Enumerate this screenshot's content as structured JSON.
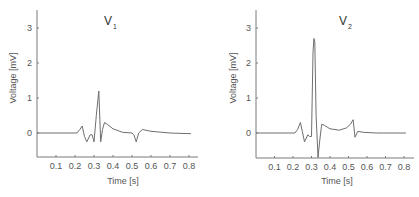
{
  "chart_data": [
    {
      "type": "line",
      "title": "V1",
      "title_main": "V",
      "title_sub": "1",
      "xlabel": "Time [s]",
      "ylabel": "Voltage [mV]",
      "xlim": [
        0,
        0.85
      ],
      "ylim": [
        -0.7,
        3.5
      ],
      "xticks": [
        0.1,
        0.2,
        0.3,
        0.4,
        0.5,
        0.6,
        0.7,
        0.8
      ],
      "xtick_labels": [
        "0.1",
        "0.2",
        "0.3",
        "0.4",
        "0.5",
        "0.6",
        "0.7",
        "0.8"
      ],
      "yticks": [
        0,
        1,
        2,
        3
      ],
      "ytick_labels": [
        "0",
        "1",
        "2",
        "3"
      ],
      "grid": false,
      "series": [
        {
          "name": "V1",
          "x": [
            0,
            0.21,
            0.225,
            0.238,
            0.25,
            0.262,
            0.28,
            0.29,
            0.3,
            0.312,
            0.325,
            0.335,
            0.345,
            0.355,
            0.37,
            0.4,
            0.45,
            0.5,
            0.51,
            0.522,
            0.535,
            0.555,
            0.6,
            0.7,
            0.81
          ],
          "y": [
            0,
            0,
            0.1,
            0.2,
            -0.1,
            -0.25,
            -0.05,
            -0.05,
            -0.25,
            0.5,
            1.2,
            -0.25,
            0.1,
            0.3,
            0.25,
            0.12,
            0.02,
            0.0,
            -0.05,
            -0.25,
            0.0,
            0.1,
            0.05,
            0.0,
            -0.02
          ]
        }
      ]
    },
    {
      "type": "line",
      "title": "V2",
      "title_main": "V",
      "title_sub": "2",
      "xlabel": "Time [s]",
      "ylabel": "Voltage [mV]",
      "xlim": [
        0,
        0.85
      ],
      "ylim": [
        -0.7,
        3.5
      ],
      "xticks": [
        0.1,
        0.2,
        0.3,
        0.4,
        0.5,
        0.6,
        0.7,
        0.8
      ],
      "xtick_labels": [
        "0.1",
        "0.2",
        "0.3",
        "0.4",
        "0.5",
        "0.6",
        "0.7",
        "0.8"
      ],
      "yticks": [
        0,
        1,
        2,
        3
      ],
      "ytick_labels": [
        "0",
        "1",
        "2",
        "3"
      ],
      "grid": false,
      "series": [
        {
          "name": "V2",
          "x": [
            0,
            0.21,
            0.225,
            0.24,
            0.25,
            0.262,
            0.28,
            0.29,
            0.3,
            0.308,
            0.313,
            0.318,
            0.325,
            0.335,
            0.345,
            0.355,
            0.37,
            0.4,
            0.45,
            0.49,
            0.51,
            0.525,
            0.535,
            0.55,
            0.58,
            0.65,
            0.81
          ],
          "y": [
            0,
            0,
            0.1,
            0.3,
            0.05,
            -0.25,
            -0.05,
            -0.1,
            -0.1,
            2.3,
            2.7,
            2.6,
            0.5,
            -0.7,
            -0.2,
            0.25,
            0.22,
            0.12,
            0.08,
            0.15,
            0.25,
            0.38,
            -0.12,
            0.05,
            0.02,
            0.0,
            0.0
          ]
        }
      ]
    }
  ],
  "charts": [
    {
      "title_main": "V",
      "title_sub": "1",
      "xlabel": "Time [s]",
      "ylabel": "Voltage [mV]"
    },
    {
      "title_main": "V",
      "title_sub": "2",
      "xlabel": "Time [s]",
      "ylabel": "Voltage [mV]"
    }
  ]
}
